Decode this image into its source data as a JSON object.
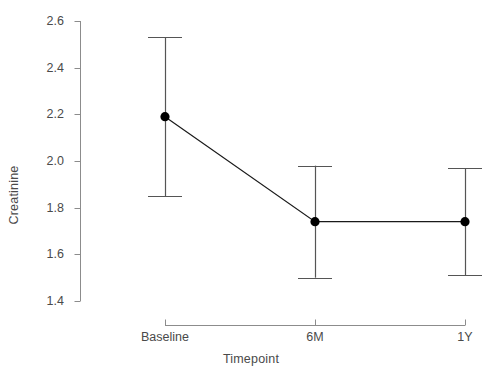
{
  "chart_data": {
    "type": "line",
    "title": "",
    "xlabel": "Timepoint",
    "ylabel": "Creatinine",
    "categories": [
      "Baseline",
      "6M",
      "1Y"
    ],
    "values": [
      2.19,
      1.74,
      1.74
    ],
    "error_low": [
      1.85,
      1.5,
      1.51
    ],
    "error_high": [
      2.53,
      1.98,
      1.97
    ],
    "ylim": [
      1.4,
      2.6
    ],
    "yticks": [
      "2.6",
      "2.4",
      "2.2",
      "2.0",
      "1.8",
      "1.6",
      "1.4"
    ],
    "ytick_values": [
      2.6,
      2.4,
      2.2,
      2.0,
      1.8,
      1.6,
      1.4
    ],
    "grid": false,
    "legend": "none",
    "marker": "filled-circle",
    "errorbar_style": "capped",
    "line_color": "#1a1a1a",
    "marker_color": "#000000",
    "errorbar_color": "#555555",
    "axis_color": "#808080",
    "text_color": "#4a4a4a"
  },
  "axes": {
    "y_axis_label": "Creatinine",
    "x_axis_label": "Timepoint"
  }
}
